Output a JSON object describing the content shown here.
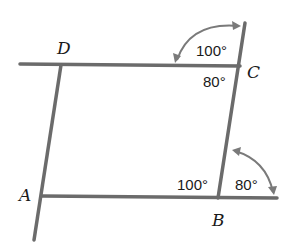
{
  "diagram": {
    "type": "parallelogram-with-transversals",
    "vertices": {
      "A": {
        "label": "A",
        "x": 42,
        "y": 197
      },
      "B": {
        "label": "B",
        "x": 218,
        "y": 197
      },
      "C": {
        "label": "C",
        "x": 238,
        "y": 65
      },
      "D": {
        "label": "D",
        "x": 60,
        "y": 65
      }
    },
    "angles": {
      "top_exterior_C": "100°",
      "interior_C": "80°",
      "interior_B": "100°",
      "exterior_B": "80°"
    },
    "colors": {
      "line": "#6b6b6b",
      "arc": "#7a7a7a",
      "text": "#1a1a1a",
      "background": "#ffffff"
    }
  }
}
